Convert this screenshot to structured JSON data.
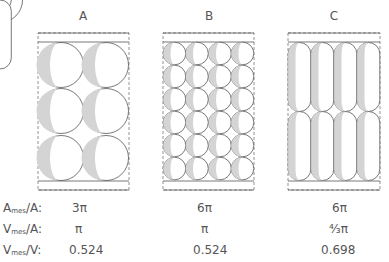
{
  "panels": [
    {
      "label": "A",
      "packing": "2 columns x 3 rows of spheres"
    },
    {
      "label": "B",
      "packing": "4 columns x 6 rows of spheres"
    },
    {
      "label": "C",
      "packing": "4 columns x 2 rows of capsules"
    }
  ],
  "table": {
    "rows": [
      {
        "label_main": "A",
        "label_sub": "mes",
        "label_tail": "/A:",
        "values": [
          "3π",
          "6π",
          "6π"
        ]
      },
      {
        "label_main": "V",
        "label_sub": "mes",
        "label_tail": "/A:",
        "values": [
          "π",
          "π",
          "⁴⁄₃π"
        ]
      },
      {
        "label_main": "V",
        "label_sub": "mes",
        "label_tail": "/V:",
        "values": [
          "0.524",
          "0.524",
          "0.698"
        ]
      }
    ]
  },
  "colors": {
    "stroke": "#555555",
    "shade": "#d4d4d4",
    "dashed": "#777777"
  }
}
